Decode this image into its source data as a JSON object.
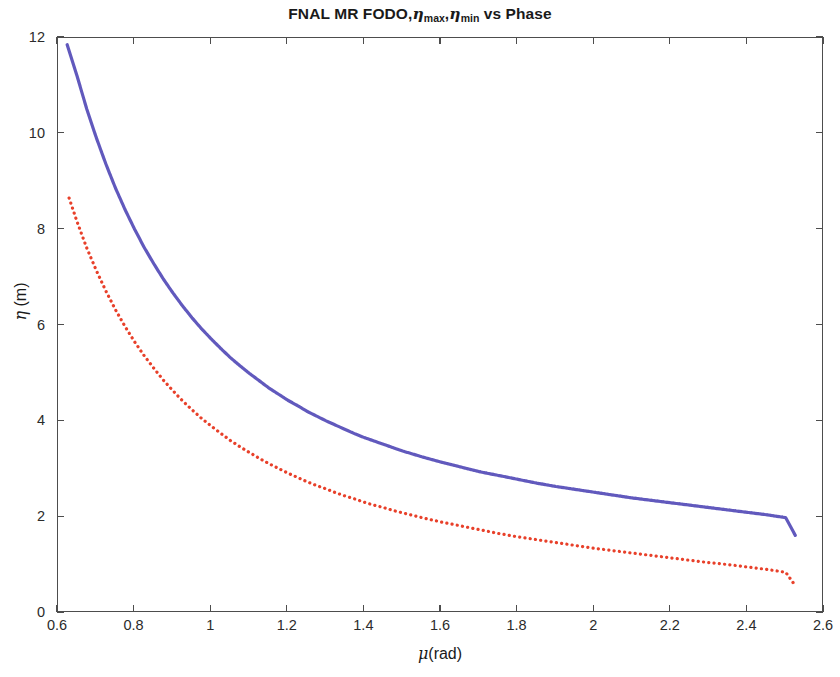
{
  "figure": {
    "title_prefix": "FNAL MR FODO,",
    "title_eta1": "η",
    "title_sub1": "max",
    "title_sep": ",",
    "title_eta2": "η",
    "title_sub2": "min",
    "title_suffix": " vs Phase",
    "title_plain": "FNAL MR FODO,ηmax,ηmin vs Phase",
    "background_color": "#ffffff",
    "axis_color": "#4d4d4d"
  },
  "axes": {
    "x_axis_title_greek": "μ",
    "x_axis_title_rest": "(rad)",
    "y_axis_title_greek": "η",
    "y_axis_title_rest": " (m)",
    "x_ticks": [
      "0.6",
      "0.8",
      "1",
      "1.2",
      "1.4",
      "1.6",
      "1.8",
      "2",
      "2.2",
      "2.4",
      "2.6"
    ],
    "y_ticks": [
      "0",
      "2",
      "4",
      "6",
      "8",
      "10",
      "12"
    ]
  },
  "chart_data": {
    "type": "line",
    "title": "FNAL MR FODO,ηmax,ηmin vs Phase",
    "xlabel": "μ(rad)",
    "ylabel": "η (m)",
    "xlim": [
      0.6,
      2.6
    ],
    "ylim": [
      0,
      12
    ],
    "xticks": [
      0.6,
      0.8,
      1.0,
      1.2,
      1.4,
      1.6,
      1.8,
      2.0,
      2.2,
      2.4,
      2.6
    ],
    "yticks": [
      0,
      2,
      4,
      6,
      8,
      10,
      12
    ],
    "grid": false,
    "legend": null,
    "series": [
      {
        "name": "ηmax",
        "color": "#6159bd",
        "style": "solid",
        "linewidth": 3.2,
        "x": [
          0.624,
          0.65,
          0.675,
          0.7,
          0.725,
          0.75,
          0.775,
          0.8,
          0.825,
          0.85,
          0.875,
          0.9,
          0.925,
          0.95,
          0.975,
          1.0,
          1.025,
          1.05,
          1.075,
          1.1,
          1.125,
          1.15,
          1.175,
          1.2,
          1.225,
          1.25,
          1.275,
          1.3,
          1.325,
          1.35,
          1.375,
          1.4,
          1.425,
          1.45,
          1.475,
          1.5,
          1.55,
          1.6,
          1.65,
          1.7,
          1.75,
          1.8,
          1.85,
          1.9,
          1.95,
          2.0,
          2.05,
          2.1,
          2.15,
          2.2,
          2.25,
          2.3,
          2.35,
          2.4,
          2.45,
          2.5,
          2.525
        ],
        "y": [
          11.86,
          11.2,
          10.52,
          9.92,
          9.37,
          8.87,
          8.42,
          8.01,
          7.63,
          7.29,
          6.97,
          6.68,
          6.41,
          6.16,
          5.93,
          5.72,
          5.52,
          5.33,
          5.16,
          5.0,
          4.85,
          4.7,
          4.57,
          4.44,
          4.33,
          4.21,
          4.11,
          4.01,
          3.92,
          3.83,
          3.74,
          3.66,
          3.59,
          3.52,
          3.45,
          3.38,
          3.26,
          3.15,
          3.05,
          2.95,
          2.87,
          2.79,
          2.71,
          2.64,
          2.58,
          2.52,
          2.46,
          2.4,
          2.35,
          2.3,
          2.25,
          2.2,
          2.15,
          2.1,
          2.05,
          1.99,
          1.62
        ]
      },
      {
        "name": "ηmin",
        "color": "#e8402a",
        "style": "dotted",
        "linewidth": 3.2,
        "x": [
          0.629,
          0.65,
          0.675,
          0.7,
          0.725,
          0.75,
          0.775,
          0.8,
          0.825,
          0.85,
          0.875,
          0.9,
          0.925,
          0.95,
          0.975,
          1.0,
          1.025,
          1.05,
          1.075,
          1.1,
          1.125,
          1.15,
          1.175,
          1.2,
          1.225,
          1.25,
          1.275,
          1.3,
          1.325,
          1.35,
          1.375,
          1.4,
          1.425,
          1.45,
          1.475,
          1.5,
          1.55,
          1.6,
          1.65,
          1.7,
          1.75,
          1.8,
          1.85,
          1.9,
          1.95,
          2.0,
          2.05,
          2.1,
          2.15,
          2.2,
          2.25,
          2.3,
          2.35,
          2.4,
          2.45,
          2.5,
          2.525
        ],
        "y": [
          8.66,
          8.16,
          7.62,
          7.15,
          6.72,
          6.33,
          5.98,
          5.66,
          5.37,
          5.11,
          4.86,
          4.64,
          4.43,
          4.24,
          4.06,
          3.9,
          3.75,
          3.6,
          3.47,
          3.35,
          3.23,
          3.12,
          3.02,
          2.92,
          2.83,
          2.74,
          2.66,
          2.59,
          2.51,
          2.44,
          2.38,
          2.31,
          2.25,
          2.2,
          2.14,
          2.09,
          1.99,
          1.9,
          1.82,
          1.74,
          1.66,
          1.59,
          1.53,
          1.47,
          1.41,
          1.35,
          1.3,
          1.25,
          1.2,
          1.15,
          1.1,
          1.05,
          1.01,
          0.96,
          0.91,
          0.85,
          0.57
        ]
      }
    ]
  }
}
